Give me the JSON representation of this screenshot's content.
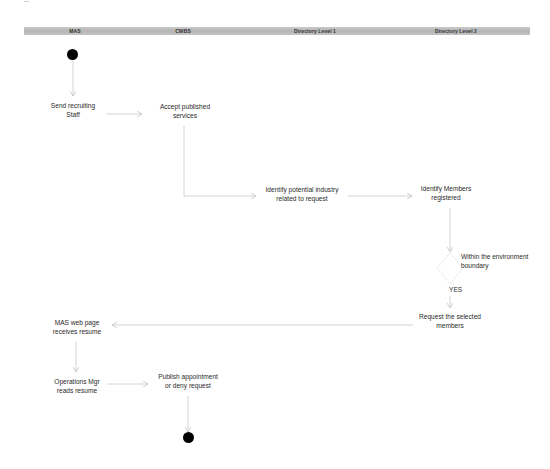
{
  "diagram": {
    "type": "activity-swimlane",
    "lanes": [
      {
        "id": "mas",
        "label": "MAS",
        "center_x": 75
      },
      {
        "id": "cwbs",
        "label": "CWBS",
        "center_x": 183
      },
      {
        "id": "dir1",
        "label": "Directory Level 1",
        "center_x": 315
      },
      {
        "id": "dir2",
        "label": "Directory Level 2",
        "center_x": 456
      }
    ],
    "nodes": {
      "start": {
        "label": "",
        "kind": "initial"
      },
      "send_recruiting": {
        "label": "Send recruiting Staff",
        "line1": "Send recruiting",
        "line2": "Staff"
      },
      "accept_published": {
        "label": "Accept published services",
        "line1": "Accept published",
        "line2": "services"
      },
      "identify_industry": {
        "label": "Identify potential industry related to request",
        "line1": "Identify potential industry",
        "line2": "related to request"
      },
      "identify_members": {
        "label": "Identify Members registered",
        "line1": "Identify Members",
        "line2": "registered"
      },
      "decision": {
        "label": "Within the environment boundary",
        "line1": "Within the environment",
        "line2": "boundary",
        "kind": "decision"
      },
      "request_members": {
        "label": "Request the selected members",
        "line1": "Request the selected",
        "line2": "members"
      },
      "mas_receives": {
        "label": "MAS web page receives resume",
        "line1": "MAS web page",
        "line2": "receives resume"
      },
      "ops_reads": {
        "label": "Operations Mgr reads resume",
        "line1": "Operations Mgr",
        "line2": "reads resume"
      },
      "publish": {
        "label": "Publish appointment or deny request",
        "line1": "Publish appointment",
        "line2": "or deny request"
      },
      "end": {
        "label": "",
        "kind": "final"
      }
    },
    "edges": [
      {
        "from": "start",
        "to": "send_recruiting",
        "label": ""
      },
      {
        "from": "send_recruiting",
        "to": "accept_published",
        "label": ""
      },
      {
        "from": "accept_published",
        "to": "identify_industry",
        "label": ""
      },
      {
        "from": "identify_industry",
        "to": "identify_members",
        "label": ""
      },
      {
        "from": "identify_members",
        "to": "decision",
        "label": ""
      },
      {
        "from": "decision",
        "to": "request_members",
        "label": "YES"
      },
      {
        "from": "request_members",
        "to": "mas_receives",
        "label": ""
      },
      {
        "from": "mas_receives",
        "to": "ops_reads",
        "label": ""
      },
      {
        "from": "ops_reads",
        "to": "publish",
        "label": ""
      },
      {
        "from": "publish",
        "to": "end",
        "label": ""
      }
    ],
    "guard_yes": "YES",
    "colors": {
      "lane_bar": "#bdbdbd",
      "edge": "#c8c8c8",
      "node_fill": "#000000",
      "text": "#2a2a2a"
    }
  }
}
